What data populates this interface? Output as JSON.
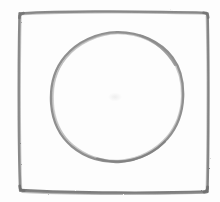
{
  "canvas": {
    "width": 220,
    "height": 202,
    "background_color": "#fdfdfd",
    "label": "hand-drawn sketch of a circle inside a square"
  },
  "palette": {
    "stroke_dark": "#7c7c7c",
    "stroke_mid": "#8d8d8d",
    "stroke_light": "#a8a8a8",
    "smudge": "#f2f2f2",
    "paper": "#fdfdfd"
  },
  "shapes": [
    {
      "name": "square-outline",
      "kind": "square",
      "stroke_color": "#828282",
      "stroke_width": 2.6,
      "left": 18,
      "top": 11,
      "right": 209,
      "bottom": 193,
      "width": 191,
      "height": 182,
      "corner_radius": 5,
      "style": "hand-drawn pencil, slightly wobbly edges"
    },
    {
      "name": "circle-outline",
      "kind": "circle",
      "stroke_color": "#8a8a8a",
      "stroke_width": 2.4,
      "center_x": 117,
      "center_y": 97,
      "radius_x": 66,
      "radius_y": 65,
      "left": 51,
      "top": 32,
      "right": 183,
      "bottom": 162,
      "style": "hand-drawn pencil, slightly irregular circumference"
    },
    {
      "name": "center-smudge",
      "kind": "smudge",
      "center_x": 115,
      "center_y": 97,
      "radius": 6,
      "color": "#f4f4f4"
    }
  ],
  "geometry_notes": {
    "relationship": "circle inscribed within square",
    "circle_inside_square": true,
    "gap_left": 33,
    "gap_right": 26,
    "gap_top": 21,
    "gap_bottom": 31
  }
}
